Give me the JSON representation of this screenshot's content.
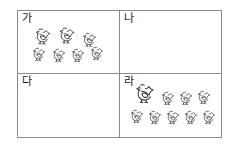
{
  "worksheet": {
    "type": "counting-grid",
    "rows": 2,
    "columns": 2,
    "border_color": "#8a8a8a",
    "background_color": "#ffffff",
    "ink_color": "#3a3a3a",
    "label_color": "#1a1a1a",
    "icon_name": "chicken-icon",
    "cells": [
      {
        "id": "cell-ga",
        "label": "가",
        "chicken_count": 7,
        "chickens": [
          {
            "x": 14,
            "y": 14,
            "w": 22,
            "h": 22
          },
          {
            "x": 38,
            "y": 13,
            "w": 22,
            "h": 22
          },
          {
            "x": 62,
            "y": 19,
            "w": 19,
            "h": 19
          },
          {
            "x": 12,
            "y": 34,
            "w": 18,
            "h": 18
          },
          {
            "x": 32,
            "y": 35,
            "w": 18,
            "h": 18
          },
          {
            "x": 51,
            "y": 35,
            "w": 18,
            "h": 18
          },
          {
            "x": 70,
            "y": 33,
            "w": 18,
            "h": 18
          }
        ]
      },
      {
        "id": "cell-na",
        "label": "나",
        "chicken_count": 0,
        "chickens": []
      },
      {
        "id": "cell-da",
        "label": "다",
        "chicken_count": 0,
        "chickens": []
      },
      {
        "id": "cell-ra",
        "label": "라",
        "chicken_count": 9,
        "chickens": [
          {
            "x": 12,
            "y": 6,
            "w": 26,
            "h": 26
          },
          {
            "x": 39,
            "y": 15,
            "w": 18,
            "h": 18
          },
          {
            "x": 57,
            "y": 15,
            "w": 18,
            "h": 18
          },
          {
            "x": 75,
            "y": 14,
            "w": 18,
            "h": 18
          },
          {
            "x": 8,
            "y": 33,
            "w": 18,
            "h": 18
          },
          {
            "x": 26,
            "y": 34,
            "w": 18,
            "h": 18
          },
          {
            "x": 44,
            "y": 34,
            "w": 18,
            "h": 18
          },
          {
            "x": 62,
            "y": 34,
            "w": 18,
            "h": 18
          },
          {
            "x": 80,
            "y": 34,
            "w": 18,
            "h": 18
          }
        ]
      }
    ]
  }
}
